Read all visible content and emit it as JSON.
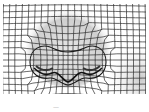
{
  "figure": {
    "background": "#ffffff",
    "line_color": "#2a2a2a",
    "shade_color": "#9a9a9a",
    "caption": "—"
  }
}
